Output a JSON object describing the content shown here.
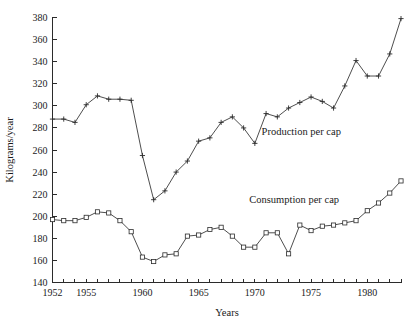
{
  "chart_data": {
    "type": "line",
    "title": "",
    "xlabel": "Years",
    "ylabel": "Kilograms/year",
    "xlim": [
      1952,
      1983
    ],
    "ylim": [
      140,
      380
    ],
    "grid": false,
    "legend_position": "inline-annotation",
    "x_ticks_every": 1,
    "x_tick_labels": [
      "1952",
      "1955",
      "1960",
      "1965",
      "1970",
      "1975",
      "1980"
    ],
    "x_tick_label_years": [
      1952,
      1955,
      1960,
      1965,
      1970,
      1975,
      1980
    ],
    "y_tick_labels": [
      "140",
      "160",
      "180",
      "200",
      "220",
      "240",
      "260",
      "280",
      "300",
      "320",
      "340",
      "360",
      "380"
    ],
    "y_tick_values": [
      140,
      160,
      180,
      200,
      220,
      240,
      260,
      280,
      300,
      320,
      340,
      360,
      380
    ],
    "x": [
      1952,
      1953,
      1954,
      1955,
      1956,
      1957,
      1958,
      1959,
      1960,
      1961,
      1962,
      1963,
      1964,
      1965,
      1966,
      1967,
      1968,
      1969,
      1970,
      1971,
      1972,
      1973,
      1974,
      1975,
      1976,
      1977,
      1978,
      1979,
      1980,
      1981,
      1982,
      1983
    ],
    "series": [
      {
        "name": "Production per cap",
        "marker": "plus",
        "values": [
          288,
          288,
          285,
          301,
          309,
          306,
          306,
          305,
          255,
          215,
          223,
          240,
          250,
          268,
          271,
          285,
          290,
          280,
          266,
          293,
          290,
          298,
          303,
          308,
          304,
          298,
          318,
          341,
          327,
          327,
          347,
          379
        ]
      },
      {
        "name": "Consumption per cap",
        "marker": "square",
        "values": [
          197,
          196,
          196,
          199,
          204,
          203,
          196,
          186,
          163,
          159,
          165,
          166,
          182,
          183,
          188,
          190,
          182,
          172,
          172,
          185,
          185,
          166,
          192,
          187,
          191,
          192,
          194,
          196,
          205,
          212,
          221,
          232
        ]
      }
    ],
    "annotations": [
      {
        "text": "Production per cap",
        "x": 1970.6,
        "y": 274
      },
      {
        "text": "Consumption per cap",
        "x": 1969.5,
        "y": 212
      }
    ]
  },
  "axes": {
    "y_axis_title": "Kilograms/year",
    "x_axis_title": "Years"
  },
  "colors": {
    "line": "#3a3a3a",
    "marker": "#2b2b2b",
    "axis": "#2b2b2b",
    "text": "#1a1a1a",
    "background": "#ffffff"
  }
}
